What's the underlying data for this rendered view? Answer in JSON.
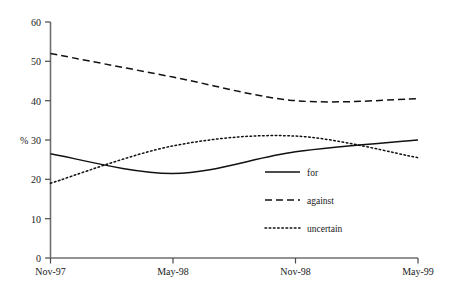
{
  "chart_data": {
    "type": "line",
    "title": "",
    "subtitle": "",
    "xlabel": "",
    "ylabel": "%",
    "categories": [
      "Nov-97",
      "May-98",
      "Nov-98",
      "May-99"
    ],
    "ylim": [
      0,
      60
    ],
    "yticks": [
      0,
      10,
      20,
      30,
      40,
      50,
      60
    ],
    "ytick_labels": [
      "0",
      "10",
      "20",
      "30",
      "40",
      "50",
      "60"
    ],
    "grid": false,
    "legend_position": "center-right-inside",
    "smoothing": "spline",
    "series": [
      {
        "name": "for",
        "style": "solid",
        "color": "#111111",
        "values": [
          26.5,
          21.5,
          27,
          30
        ]
      },
      {
        "name": "against",
        "style": "dashed",
        "color": "#111111",
        "values": [
          52,
          46,
          40,
          40.5
        ]
      },
      {
        "name": "uncertain",
        "style": "dotted",
        "color": "#111111",
        "values": [
          19,
          28.5,
          31,
          25.5
        ]
      }
    ]
  },
  "axis": {
    "y_title": "%",
    "y_tick_labels": [
      "60",
      "50",
      "40",
      "30",
      "20",
      "10",
      "0"
    ],
    "x_tick_labels": [
      "Nov-97",
      "May-98",
      "Nov-98",
      "May-99"
    ]
  },
  "legend": {
    "items": [
      {
        "label": "for"
      },
      {
        "label": "against"
      },
      {
        "label": "uncertain"
      }
    ]
  }
}
